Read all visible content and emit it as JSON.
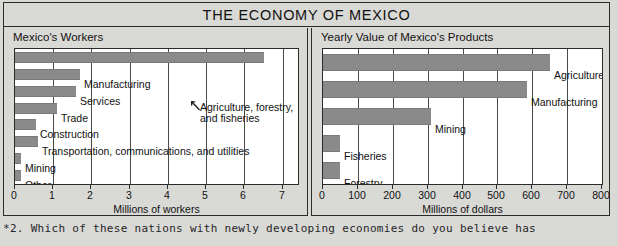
{
  "figure": {
    "title": "THE ECONOMY OF MEXICO"
  },
  "caption": "*2. Which of these nations with newly developing economies do you believe has",
  "annotation": {
    "arrow_icon": "arrow-up-left-icon",
    "line1": "Agriculture, forestry,",
    "line2": "and fisheries"
  },
  "chart_data": [
    {
      "type": "bar",
      "orientation": "horizontal",
      "title": "Mexico's Workers",
      "xlabel": "Millions of workers",
      "ylabel": "",
      "xlim": [
        0,
        7.4
      ],
      "xticks": [
        0,
        1,
        2,
        3,
        4,
        5,
        6,
        7
      ],
      "xticklabels": [
        "0",
        "1",
        "2",
        "3",
        "4",
        "5",
        "6",
        "7"
      ],
      "grid": true,
      "legend": "none",
      "bar_color": "#8a8a8a",
      "categories": [
        "Agriculture, forestry, and fisheries",
        "Manufacturing",
        "Services",
        "Trade",
        "Construction",
        "Transportation, communications, and utilities",
        "Mining",
        "Other"
      ],
      "values": [
        6.5,
        1.7,
        1.6,
        1.1,
        0.55,
        0.6,
        0.15,
        0.15
      ],
      "labels_shown": [
        "",
        "Manufacturing",
        "Services",
        "Trade",
        "Construction",
        "Transportation, communications, and utilities",
        "Mining",
        "Other"
      ]
    },
    {
      "type": "bar",
      "orientation": "horizontal",
      "title": "Yearly Value of Mexico's Products",
      "xlabel": "Millions of dollars",
      "ylabel": "",
      "xlim": [
        0,
        800
      ],
      "xticks": [
        0,
        100,
        200,
        300,
        400,
        500,
        600,
        700,
        800
      ],
      "xticklabels": [
        "0",
        "100",
        "200",
        "300",
        "400",
        "500",
        "600",
        "700",
        "800"
      ],
      "grid": true,
      "legend": "none",
      "bar_color": "#8a8a8a",
      "categories": [
        "Agriculture",
        "Manufacturing",
        "Mining",
        "Fisheries",
        "Forestry"
      ],
      "values": [
        650,
        585,
        310,
        50,
        50
      ],
      "labels_shown": [
        "Agriculture",
        "Manufacturing",
        "Mining",
        "Fisheries",
        "Forestry"
      ]
    }
  ]
}
